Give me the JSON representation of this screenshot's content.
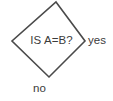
{
  "diagram": {
    "type": "flowchart-decision",
    "shape": "diamond",
    "decision_text": "IS A=B?",
    "branches": {
      "yes_label": "yes",
      "no_label": "no"
    },
    "colors": {
      "outline": "#4a4a4a",
      "fill": "#ffffff",
      "text": "#3b3b3b",
      "background": "#ffffff"
    },
    "geometry": {
      "top_vertex": [
        56,
        2
      ],
      "right_vertex": [
        85,
        41
      ],
      "bottom_vertex": [
        49,
        77
      ],
      "left_vertex": [
        12,
        41
      ]
    }
  }
}
